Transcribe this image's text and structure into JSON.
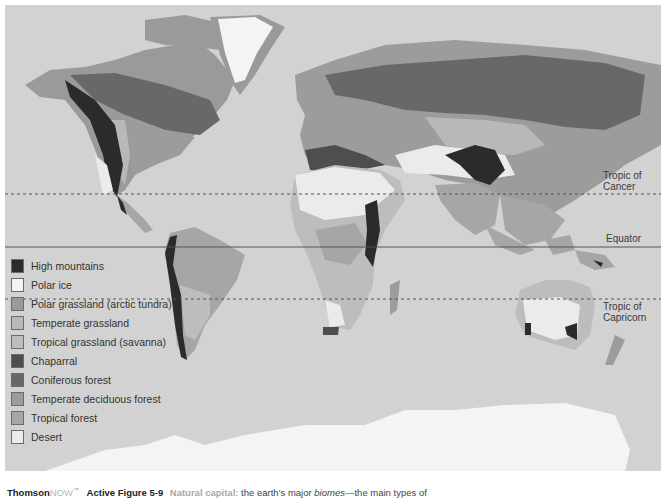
{
  "figure": {
    "type": "world biome map",
    "background_color": "#d2d2d2"
  },
  "latitude_lines": [
    {
      "name": "Tropic of Cancer",
      "label_line1": "Tropic of",
      "label_line2": "Cancer",
      "style": "dashed"
    },
    {
      "name": "Equator",
      "label_line1": "Equator",
      "label_line2": "",
      "style": "solid"
    },
    {
      "name": "Tropic of Capricorn",
      "label_line1": "Tropic of",
      "label_line2": "Capricorn",
      "style": "dashed"
    }
  ],
  "legend": {
    "items": [
      {
        "label": "High mountains",
        "color": "#2b2b2b"
      },
      {
        "label": "Polar ice",
        "color": "#f4f4f4"
      },
      {
        "label": "Polar grassland (arctic tundra)",
        "color": "#9a9a9a"
      },
      {
        "label": "Temperate grassland",
        "color": "#b8b8b8"
      },
      {
        "label": "Tropical grassland (savanna)",
        "color": "#bdbdbd"
      },
      {
        "label": "Chaparral",
        "color": "#4e4e4e"
      },
      {
        "label": "Coniferous forest",
        "color": "#686868"
      },
      {
        "label": "Temperate deciduous forest",
        "color": "#9c9c9c"
      },
      {
        "label": "Tropical forest",
        "color": "#a6a6a6"
      },
      {
        "label": "Desert",
        "color": "#ebebeb"
      }
    ]
  },
  "caption": {
    "brand_part1": "Thomson",
    "brand_part2": "NOW",
    "brand_mark": "™",
    "figure_label": "Active Figure 5-9",
    "highlight": "Natural capital:",
    "text_before": " the earth’s major ",
    "text_italic": "biomes",
    "text_after": "—the main types of"
  }
}
